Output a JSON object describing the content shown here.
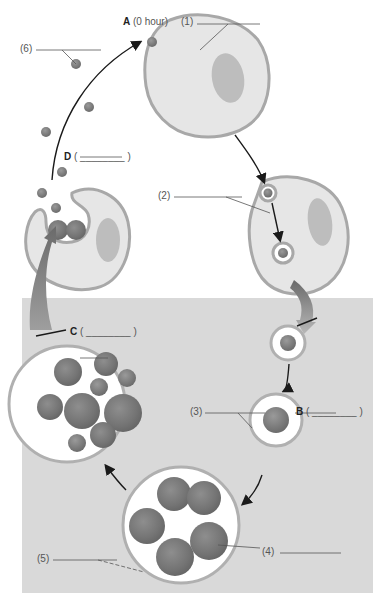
{
  "header": {
    "cut_text": "ry body by phagocytosis of a host cell and the develop"
  },
  "stages": {
    "A": {
      "letter": "A",
      "text": "(0 hour)"
    },
    "B": {
      "letter": "B",
      "text": "( ________ )"
    },
    "C": {
      "letter": "C",
      "text": "( ________ )"
    },
    "D": {
      "letter": "D",
      "text": "( ________ )"
    }
  },
  "labels": {
    "l1": "(1)",
    "l2": "(2)",
    "l3": "(3)",
    "l4": "(4)",
    "l5": "(5)",
    "l6": "(6)"
  },
  "colors": {
    "background": "#ffffff",
    "inside_region": "#d9d9d9",
    "cell_fill": "#e6e6e6",
    "cell_border": "#a8a8a8",
    "nucleus": "#b9b9b9",
    "body": "#7f7f7f",
    "arrow": "#1a1a1a"
  }
}
